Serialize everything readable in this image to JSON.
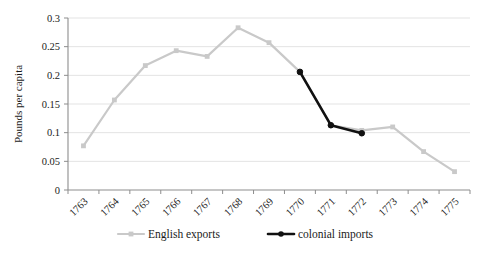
{
  "chart_data": {
    "type": "line",
    "title": "",
    "xlabel": "",
    "ylabel": "Pounds per capita",
    "categories": [
      "1763",
      "1764",
      "1765",
      "1766",
      "1767",
      "1768",
      "1769",
      "1770",
      "1771",
      "1772",
      "1773",
      "1774",
      "1775"
    ],
    "ylim": [
      0,
      0.3
    ],
    "yticks": [
      0,
      0.05,
      0.1,
      0.15,
      0.2,
      0.25,
      0.3
    ],
    "ytick_labels": [
      "0",
      "0.05",
      "0.1",
      "0.15",
      "0.2",
      "0.25",
      "0.3"
    ],
    "grid": true,
    "legend_position": "bottom",
    "series": [
      {
        "name": "English exports",
        "color": "#c9c9c9",
        "marker": "square",
        "values": [
          0.077,
          0.157,
          0.217,
          0.243,
          0.233,
          0.283,
          0.257,
          0.206,
          0.113,
          0.104,
          0.11,
          0.067,
          0.032
        ]
      },
      {
        "name": "colonial imports",
        "color": "#111111",
        "marker": "circle",
        "values": [
          null,
          null,
          null,
          null,
          null,
          null,
          null,
          0.206,
          0.113,
          0.099,
          null,
          null,
          null
        ]
      }
    ]
  },
  "legend": {
    "items": [
      {
        "label": "English exports",
        "color": "#c9c9c9"
      },
      {
        "label": "colonial imports",
        "color": "#111111"
      }
    ]
  },
  "axis": {
    "y_title": "Pounds per capita"
  }
}
